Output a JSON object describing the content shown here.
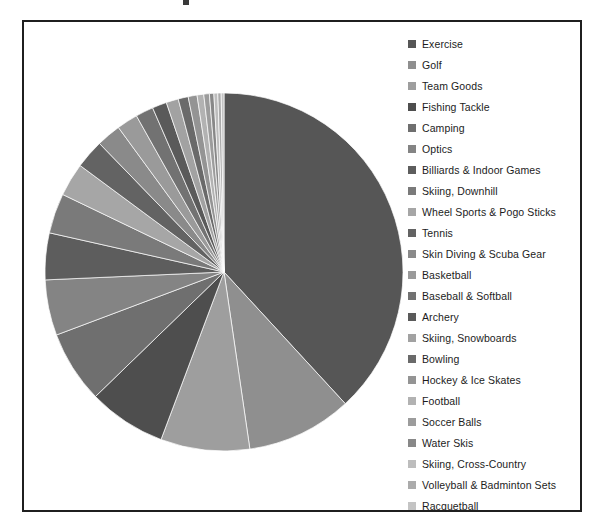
{
  "chart_data": {
    "type": "pie",
    "title": "",
    "legend_position": "right",
    "start_angle_deg": 0,
    "direction": "clockwise",
    "categories": [
      "Exercise",
      "Golf",
      "Team Goods",
      "Fishing Tackle",
      "Camping",
      "Optics",
      "Billiards & Indoor Games",
      "Skiing, Downhill",
      "Wheel Sports & Pogo Sticks",
      "Tennis",
      "Skin Diving & Scuba Gear",
      "Basketball",
      "Baseball & Softball",
      "Archery",
      "Skiing, Snowboards",
      "Bowling",
      "Hockey & Ice Skates",
      "Football",
      "Soccer Balls",
      "Water Skis",
      "Skiing, Cross-Country",
      "Volleyball & Badminton Sets",
      "Racquetball"
    ],
    "values": [
      38.0,
      9.5,
      8.0,
      7.0,
      6.5,
      5.0,
      4.2,
      3.6,
      3.0,
      2.6,
      2.2,
      1.9,
      1.6,
      1.3,
      1.1,
      0.9,
      0.8,
      0.6,
      0.5,
      0.4,
      0.35,
      0.3,
      0.25
    ],
    "colors": [
      "#565656",
      "#8f8f8f",
      "#9e9e9e",
      "#4e4e4e",
      "#6f6f6f",
      "#848484",
      "#5d5d5d",
      "#7a7a7a",
      "#a6a6a6",
      "#636363",
      "#8a8a8a",
      "#9a9a9a",
      "#727272",
      "#5a5a5a",
      "#a2a2a2",
      "#6a6a6a",
      "#949494",
      "#b2b2b2",
      "#9c9c9c",
      "#888888",
      "#bdbdbd",
      "#ababab",
      "#c4c4c4"
    ],
    "xlabel": "",
    "ylabel": ""
  },
  "legend": {
    "entries": [
      {
        "label": "Exercise",
        "color": "#565656"
      },
      {
        "label": "Golf",
        "color": "#8f8f8f"
      },
      {
        "label": "Team Goods",
        "color": "#9e9e9e"
      },
      {
        "label": "Fishing Tackle",
        "color": "#4e4e4e"
      },
      {
        "label": "Camping",
        "color": "#6f6f6f"
      },
      {
        "label": "Optics",
        "color": "#848484"
      },
      {
        "label": "Billiards & Indoor Games",
        "color": "#5d5d5d"
      },
      {
        "label": "Skiing, Downhill",
        "color": "#7a7a7a"
      },
      {
        "label": "Wheel Sports & Pogo Sticks",
        "color": "#a6a6a6"
      },
      {
        "label": "Tennis",
        "color": "#636363"
      },
      {
        "label": "Skin Diving & Scuba Gear",
        "color": "#8a8a8a"
      },
      {
        "label": "Basketball",
        "color": "#9a9a9a"
      },
      {
        "label": "Baseball & Softball",
        "color": "#727272"
      },
      {
        "label": "Archery",
        "color": "#5a5a5a"
      },
      {
        "label": "Skiing, Snowboards",
        "color": "#a2a2a2"
      },
      {
        "label": "Bowling",
        "color": "#6a6a6a"
      },
      {
        "label": "Hockey & Ice Skates",
        "color": "#949494"
      },
      {
        "label": "Football",
        "color": "#b2b2b2"
      },
      {
        "label": "Soccer Balls",
        "color": "#9c9c9c"
      },
      {
        "label": "Water Skis",
        "color": "#888888"
      },
      {
        "label": "Skiing, Cross-Country",
        "color": "#bdbdbd"
      },
      {
        "label": "Volleyball & Badminton Sets",
        "color": "#ababab"
      },
      {
        "label": "Racquetball",
        "color": "#c4c4c4"
      }
    ]
  }
}
